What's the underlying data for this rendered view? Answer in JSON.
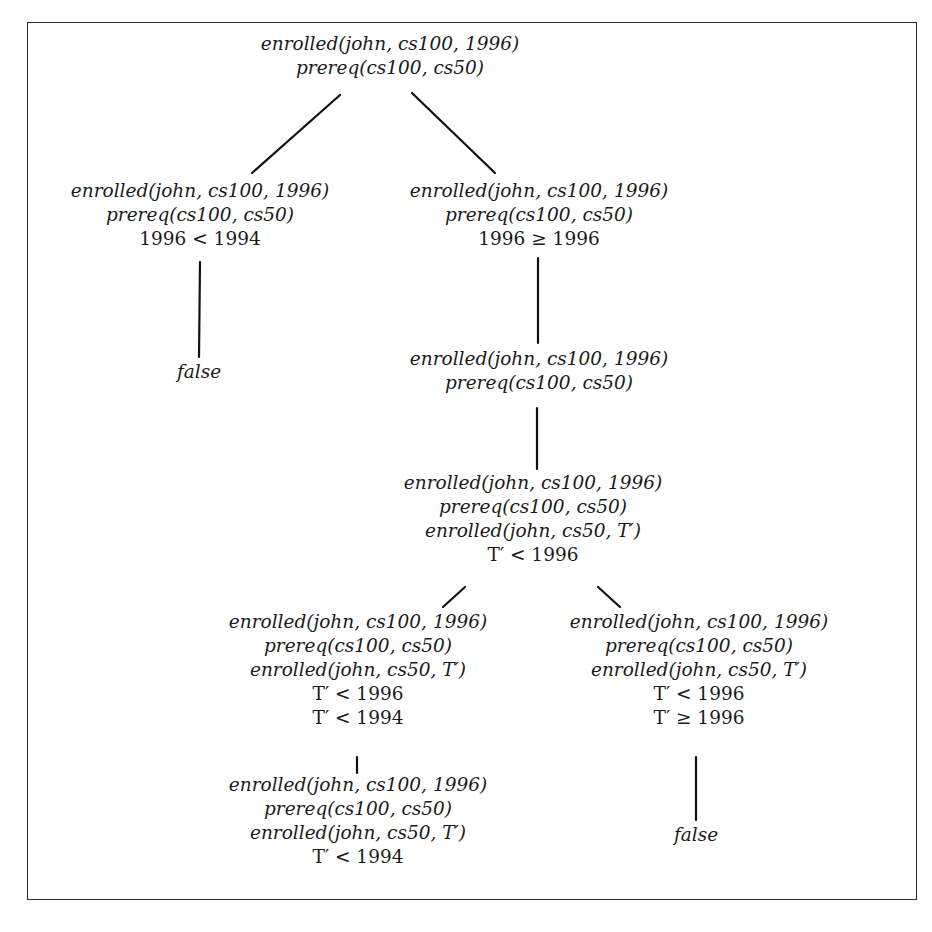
{
  "diagram": {
    "type": "derivation-tree",
    "nodes": [
      {
        "id": "n0",
        "cx": 390,
        "top": 32,
        "lines": [
          {
            "text": "enrolled(john, cs100, 1996)",
            "italic": true
          },
          {
            "text": "prereq(cs100, cs50)",
            "italic": true
          }
        ]
      },
      {
        "id": "n1",
        "cx": 200,
        "top": 179,
        "lines": [
          {
            "text": "enrolled(john, cs100, 1996)",
            "italic": true
          },
          {
            "text": "prereq(cs100, cs50)",
            "italic": true
          },
          {
            "text": "1996 < 1994",
            "italic": false
          }
        ]
      },
      {
        "id": "n2",
        "cx": 539,
        "top": 179,
        "lines": [
          {
            "text": "enrolled(john, cs100, 1996)",
            "italic": true
          },
          {
            "text": "prereq(cs100, cs50)",
            "italic": true
          },
          {
            "text": "1996 ≥ 1996",
            "italic": false
          }
        ]
      },
      {
        "id": "n3",
        "cx": 199,
        "top": 360,
        "lines": [
          {
            "text": "false",
            "italic": true
          }
        ]
      },
      {
        "id": "n4",
        "cx": 539,
        "top": 347,
        "lines": [
          {
            "text": "enrolled(john, cs100, 1996)",
            "italic": true
          },
          {
            "text": "prereq(cs100, cs50)",
            "italic": true
          }
        ]
      },
      {
        "id": "n5",
        "cx": 533,
        "top": 471,
        "lines": [
          {
            "text": "enrolled(john, cs100, 1996)",
            "italic": true
          },
          {
            "text": "prereq(cs100, cs50)",
            "italic": true
          },
          {
            "text": "enrolled(john, cs50, T′)",
            "italic": true
          },
          {
            "text": "T′ < 1996",
            "italic": false
          }
        ]
      },
      {
        "id": "n6",
        "cx": 358,
        "top": 610,
        "lines": [
          {
            "text": "enrolled(john, cs100, 1996)",
            "italic": true
          },
          {
            "text": "prereq(cs100, cs50)",
            "italic": true
          },
          {
            "text": "enrolled(john, cs50, T′)",
            "italic": true
          },
          {
            "text": "T′ < 1996",
            "italic": false
          },
          {
            "text": "T′ < 1994",
            "italic": false
          }
        ]
      },
      {
        "id": "n7",
        "cx": 699,
        "top": 610,
        "lines": [
          {
            "text": "enrolled(john, cs100, 1996)",
            "italic": true
          },
          {
            "text": "prereq(cs100, cs50)",
            "italic": true
          },
          {
            "text": "enrolled(john, cs50, T′)",
            "italic": true
          },
          {
            "text": "T′ < 1996",
            "italic": false
          },
          {
            "text": "T′ ≥ 1996",
            "italic": false
          }
        ]
      },
      {
        "id": "n8",
        "cx": 358,
        "top": 773,
        "lines": [
          {
            "text": "enrolled(john, cs100, 1996)",
            "italic": true
          },
          {
            "text": "prereq(cs100, cs50)",
            "italic": true
          },
          {
            "text": "enrolled(john, cs50, T′)",
            "italic": true
          },
          {
            "text": "T′ < 1994",
            "italic": false
          }
        ]
      },
      {
        "id": "n9",
        "cx": 696,
        "top": 823,
        "lines": [
          {
            "text": "false",
            "italic": true
          }
        ]
      }
    ],
    "edges": [
      {
        "from": "n0",
        "to": "n1",
        "x1": 340,
        "y1": 95,
        "x2": 252,
        "y2": 173
      },
      {
        "from": "n0",
        "to": "n2",
        "x1": 412,
        "y1": 93,
        "x2": 495,
        "y2": 173
      },
      {
        "from": "n1",
        "to": "n3",
        "x1": 200,
        "y1": 262,
        "x2": 199,
        "y2": 357
      },
      {
        "from": "n2",
        "to": "n4",
        "x1": 538,
        "y1": 258,
        "x2": 538,
        "y2": 343
      },
      {
        "from": "n4",
        "to": "n5",
        "x1": 537,
        "y1": 408,
        "x2": 537,
        "y2": 469
      },
      {
        "from": "n5",
        "to": "n6",
        "x1": 465,
        "y1": 587,
        "x2": 443,
        "y2": 607
      },
      {
        "from": "n5",
        "to": "n7",
        "x1": 598,
        "y1": 587,
        "x2": 620,
        "y2": 607
      },
      {
        "from": "n6",
        "to": "n8",
        "x1": 357,
        "y1": 757,
        "x2": 357,
        "y2": 773
      },
      {
        "from": "n7",
        "to": "n9",
        "x1": 696,
        "y1": 757,
        "x2": 696,
        "y2": 820
      }
    ]
  }
}
